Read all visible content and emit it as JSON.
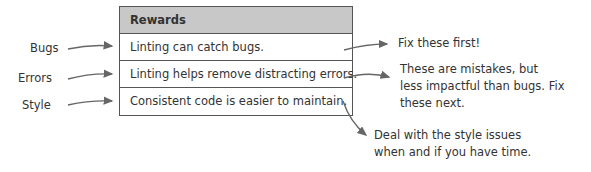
{
  "table": {
    "header": "Rewards",
    "rows": [
      "Linting can catch bugs.",
      "Linting helps remove distracting errors.",
      "Consistent code is easier to maintain."
    ]
  },
  "left_labels": [
    "Bugs",
    "Errors",
    "Style"
  ],
  "annotations": {
    "bugs": "Fix these first!",
    "errors": [
      "These are mistakes, but",
      "less impactful than bugs. Fix",
      "these next."
    ],
    "style": [
      "Deal with the style issues",
      "when and if you have time."
    ]
  },
  "colors": {
    "header_bg": "#c8c8c8",
    "border": "#555555",
    "ink": "#333333"
  }
}
